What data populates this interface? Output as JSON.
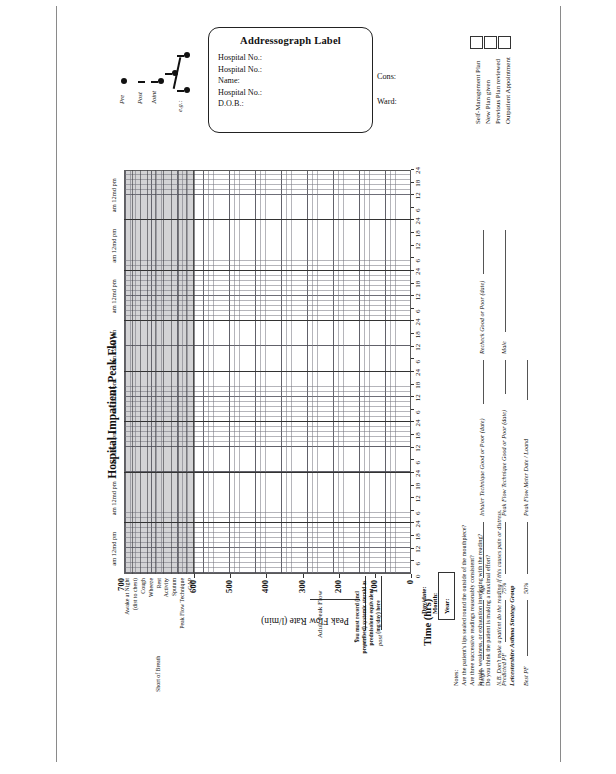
{
  "document": {
    "title": "Hospital Impatient Peak Flow",
    "orientation": "landscape-rotated"
  },
  "addressograph": {
    "title": "Addressograph Label",
    "fields": [
      "Hospital No.:",
      "Hospital No.:",
      "Name:",
      "Hospital No.:",
      "D.O.B.:"
    ],
    "side_fields": [
      "Cons:",
      "Ward:"
    ]
  },
  "legend": {
    "items": [
      {
        "label": "Pre",
        "symbol": "filled-circle"
      },
      {
        "label": "Post",
        "symbol": "horizontal-bar"
      },
      {
        "label": "Joint",
        "symbol": "bar-and-circle"
      },
      {
        "label": "e.g.:",
        "symbol": "combined-marker"
      }
    ]
  },
  "plan_checklist": {
    "items": [
      "Self-Management Plan",
      "New Plan given",
      "Previous Plan reviewed",
      "Outpatient Appointment"
    ],
    "checkbox_count": 3
  },
  "chart_data": {
    "type": "table",
    "title": "Hospital Impatient Peak Flow",
    "xlabel": "Time (hrs)",
    "ylabel": "Peak Flow Rate (l/min)",
    "ylim": [
      0,
      700
    ],
    "yticks": [
      0,
      100,
      200,
      300,
      400,
      500,
      600,
      700
    ],
    "ytick_labels": [
      "0",
      "100",
      "200",
      "300",
      "400",
      "500",
      "600",
      "700"
    ],
    "day_count": 8,
    "day_header": "am  12md  pm",
    "xticks_per_day": [
      6,
      12,
      18,
      24
    ],
    "xtick_labels": [
      "6",
      "12",
      "18",
      "24"
    ],
    "grid": true,
    "legend_position": "top-left",
    "symptom_rows": [
      "Awake at Night",
      "(dist to chest)",
      "Cough",
      "Wheeze",
      "Rest",
      "Activity",
      "Sputum",
      "Peak Flow Technique",
      "GAP"
    ],
    "symptom_groups": [
      {
        "label": "Short of Breath",
        "rows": [
          "Rest",
          "Activity"
        ]
      }
    ],
    "annotations": {
      "pre_marker": "pre",
      "post_marker": "post",
      "adult_peak_flow": "Adult Peak Flow",
      "peak_value_top": "700",
      "steroid_note": "You must record (incl prescribed) systemic steroid as prednisolone equivalent (mg/day) here"
    },
    "date_rows": [
      "Day/date:",
      "Month:",
      "Year:"
    ]
  },
  "notes": {
    "heading": "Notes:",
    "lines": [
      "Are the patient's lips sealed round the outside of the mouthpiece?",
      "Are three successive readings reasonably consistent?",
      "Is pain, weakness, or exhaustion interfering with the reading?",
      "Do you think the patient is making a maximal effort?"
    ],
    "footnote": "N.B. Don't make a patient do the reading if this causes pain or distress."
  },
  "form_fields": {
    "row1": [
      {
        "label": "Height",
        "value": ""
      },
      {
        "label": "Age",
        "value": ""
      },
      {
        "label": "Inhaler Technique Good or Poor (date)",
        "value": ""
      },
      {
        "label": "Recheck Good or Poor (date)",
        "value": ""
      }
    ],
    "row2": [
      {
        "label": "Predicted PF",
        "value": ""
      },
      {
        "label": "75%",
        "value": ""
      },
      {
        "label": "Peak Flow Technique Good or Poor (date)",
        "value": ""
      },
      {
        "label": "Male",
        "value": ""
      }
    ],
    "row3": [
      {
        "label": "Best PF",
        "value": ""
      },
      {
        "label": "50%",
        "value": ""
      },
      {
        "label": "Peak Flow Meter Date / Loand",
        "value": ""
      }
    ]
  },
  "footer": {
    "group": "Leicestershire Asthma Strategy Group"
  }
}
